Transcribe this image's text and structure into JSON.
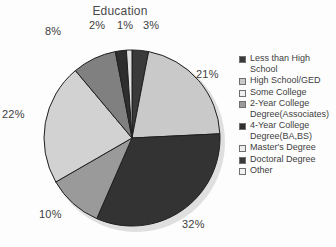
{
  "chart_data": {
    "type": "pie",
    "title": "Education",
    "xlabel": "",
    "ylabel": "",
    "legend_position": "right",
    "grid": false,
    "start_angle_deg": 0,
    "direction": "clockwise",
    "categories": [
      "Less than High School",
      "High School/GED",
      "Some College",
      "2-Year College Degree(Associates)",
      "4-Year College Degree(BA,BS)",
      "Master's Degree",
      "Doctoral Degree",
      "Other"
    ],
    "values": [
      3,
      21,
      32,
      10,
      22,
      8,
      2,
      1
    ],
    "value_labels": [
      "3%",
      "21%",
      "32%",
      "10%",
      "22%",
      "8%",
      "2%",
      "1%"
    ],
    "colors": [
      "#3a3a3a",
      "#c9c9c9",
      "#333333",
      "#9a9a9a",
      "#d2d2d2",
      "#808080",
      "#2e2e2e",
      "#e0e0e0"
    ],
    "slice_outline_color": "#1f1f1f",
    "label_color": "#404040"
  },
  "legend": {
    "items": [
      {
        "label": "Less than High School",
        "color": "#3a3a3a"
      },
      {
        "label": "High School/GED",
        "color": "#c9c9c9"
      },
      {
        "label": "Some College",
        "color": "#f0f0f0"
      },
      {
        "label": "2-Year College Degree(Associates)",
        "color": "#9a9a9a"
      },
      {
        "label": "4-Year College Degree(BA,BS)",
        "color": "#2f2f2f"
      },
      {
        "label": "Master's Degree",
        "color": "#ededed"
      },
      {
        "label": "Doctoral Degree",
        "color": "#3a3a3a"
      },
      {
        "label": "Other",
        "color": "#f2f2f2"
      }
    ]
  },
  "labels": {
    "l_8": "8%",
    "l_2": "2%",
    "l_1": "1%",
    "l_3": "3%",
    "l_21": "21%",
    "l_32": "32%",
    "l_10": "10%",
    "l_22": "22%"
  }
}
